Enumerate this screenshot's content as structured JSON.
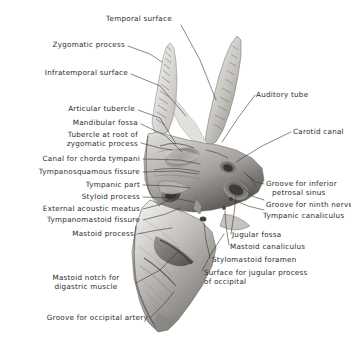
{
  "plate": {
    "title": "Temporal bone, inferior and lateral aspect",
    "background_color": "#ffffff",
    "ink_color": "#2b2b2b",
    "bone_tone_light": "#f2f1ef",
    "bone_tone_mid": "#b9b7b3",
    "bone_tone_dark": "#6e6b66",
    "bone_tone_darkest": "#3d3b38"
  },
  "labels": {
    "temporal_surface": "Temporal surface",
    "zygomatic_process": "Zygomatic process",
    "infratemporal_surface": "Infratemporal surface",
    "articular_tubercle": "Articular tubercle",
    "mandibular_fossa": "Mandibular fossa",
    "tubercle_root_zygomatic_line1": "Tubercle at root of",
    "tubercle_root_zygomatic_line2": "zygomatic process",
    "canal_chorda_tympani": "Canal for chorda tympani",
    "tympanosquamous_fissure": "Tympanosquamous fissure",
    "tympanic_part": "Tympanic part",
    "styloid_process": "Styloid process",
    "external_acoustic_meatus": "External acoustic meatus",
    "tympanomastoid_fissure": "Tympanomastoid fissure",
    "mastoid_process": "Mastoid process",
    "mastoid_notch_line1": "Mastoid notch for",
    "mastoid_notch_line2": "digastric muscle",
    "groove_occipital_artery": "Groove for occipital artery",
    "auditory_tube": "Auditory tube",
    "carotid_canal": "Carotid canal",
    "groove_inferior_petrosal_line1": "Groove for inferior",
    "groove_inferior_petrosal_line2": "petrosal sinus",
    "groove_ninth_nerve": "Groove for ninth nerve",
    "tympanic_canaliculus": "Tympanic canaliculus",
    "jugular_fossa": "Jugular fossa",
    "mastoid_canaliculus": "Mastoid canaliculus",
    "stylomastoid_foramen": "Stylomastoid foramen",
    "surface_jugular_process_line1": "Surface for jugular process",
    "surface_jugular_process_line2": "of occipital"
  }
}
